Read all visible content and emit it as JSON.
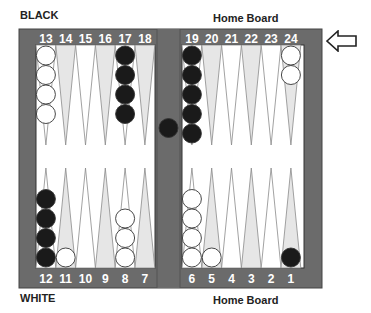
{
  "labels": {
    "top_left": "BLACK",
    "top_right": "Home Board",
    "bottom_left": "WHITE",
    "bottom_right": "Home Board"
  },
  "colors": {
    "frame": "#6b6b6b",
    "frame_edge": "#444444",
    "field": "#ffffff",
    "point_light": "#ffffff",
    "point_shaded": "#e6e6e6",
    "point_outline": "#8a8a8a",
    "black_checker": "#1a1a1a",
    "white_checker": "#ffffff",
    "label_text": "#ffffff"
  },
  "top_points": [
    "13",
    "14",
    "15",
    "16",
    "17",
    "18",
    "19",
    "20",
    "21",
    "22",
    "23",
    "24"
  ],
  "bottom_points": [
    "12",
    "11",
    "10",
    "9",
    "8",
    "7",
    "6",
    "5",
    "4",
    "3",
    "2",
    "1"
  ],
  "position": {
    "1": {
      "color": "black",
      "count": 1
    },
    "6": {
      "color": "white",
      "count": 4
    },
    "5": {
      "color": "white",
      "count": 1
    },
    "8": {
      "color": "white",
      "count": 3
    },
    "11": {
      "color": "white",
      "count": 1
    },
    "12": {
      "color": "black",
      "count": 4
    },
    "13": {
      "color": "white",
      "count": 4
    },
    "17": {
      "color": "black",
      "count": 4
    },
    "19": {
      "color": "black",
      "count": 5
    },
    "24": {
      "color": "white",
      "count": 2
    },
    "bar": {
      "color": "black",
      "count": 1
    }
  },
  "direction_indicator": "left-arrow-icon"
}
